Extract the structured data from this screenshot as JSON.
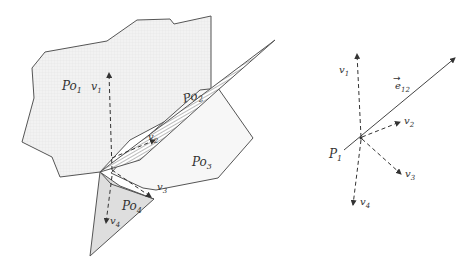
{
  "left_figure": {
    "polygons": [
      {
        "id": "Po1",
        "label_main": "Po",
        "label_sub": "1",
        "fill": "#ececec"
      },
      {
        "id": "Po2",
        "label_main": "Po",
        "label_sub": "2",
        "fill": "hatched"
      },
      {
        "id": "Po3",
        "label_main": "Po",
        "label_sub": "3",
        "fill": "#f6f6f6"
      },
      {
        "id": "Po4",
        "label_main": "Po",
        "label_sub": "4",
        "fill": "#dcdcdc"
      }
    ],
    "vectors": [
      {
        "id": "v1",
        "label_main": "v",
        "label_sub": "1"
      },
      {
        "id": "v2",
        "label_main": "v",
        "label_sub": "2"
      },
      {
        "id": "v3",
        "label_main": "v",
        "label_sub": "3"
      },
      {
        "id": "v4",
        "label_main": "v",
        "label_sub": "4"
      }
    ]
  },
  "right_figure": {
    "point": {
      "label_main": "P",
      "label_sub": "1"
    },
    "edge": {
      "label_main": "e",
      "label_sub": "12",
      "arrow": "→"
    },
    "vectors": [
      {
        "id": "v1",
        "label_main": "v",
        "label_sub": "1"
      },
      {
        "id": "v2",
        "label_main": "v",
        "label_sub": "2"
      },
      {
        "id": "v3",
        "label_main": "v",
        "label_sub": "3"
      },
      {
        "id": "v4",
        "label_main": "v",
        "label_sub": "4"
      }
    ]
  }
}
